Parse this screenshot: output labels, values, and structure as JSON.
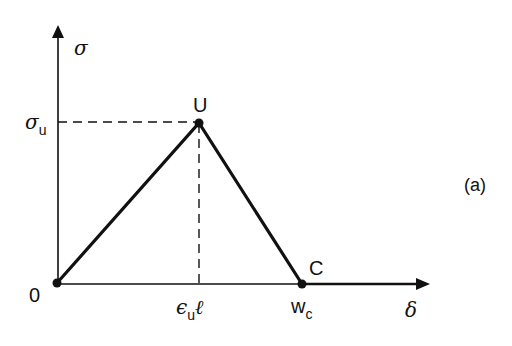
{
  "diagram": {
    "type": "stress-displacement softening curve",
    "panel_label": "(a)",
    "axes": {
      "y_label": "σ",
      "x_label": "δ"
    },
    "points": {
      "origin": {
        "label": "0"
      },
      "peak": {
        "label": "U"
      },
      "critical": {
        "label": "C"
      }
    },
    "y_ticks": [
      {
        "symbol": "σ",
        "subscript": "u"
      }
    ],
    "x_ticks": [
      {
        "symbol": "ϵ",
        "subscript": "u",
        "suffix": "ℓ"
      },
      {
        "symbol": "w",
        "subscript": "c"
      }
    ],
    "colors": {
      "ink": "#111111",
      "background": "#ffffff"
    }
  }
}
